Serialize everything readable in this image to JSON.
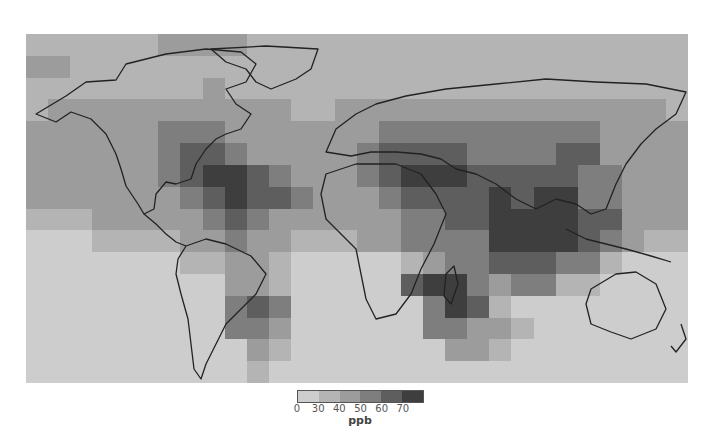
{
  "figure": {
    "type": "global choropleth map",
    "quantity_unit": "ppb"
  },
  "colorbar": {
    "unit_label": "ppb",
    "tick_labels": [
      "0",
      "30",
      "40",
      "50",
      "60",
      "70"
    ],
    "bins": [
      {
        "range": "0-30",
        "color": "#cdcdcd"
      },
      {
        "range": "30-40",
        "color": "#b4b4b4"
      },
      {
        "range": "40-50",
        "color": "#9c9c9c"
      },
      {
        "range": "50-60",
        "color": "#7e7e7e"
      },
      {
        "range": "60-70",
        "color": "#5e5e5e"
      },
      {
        "range": "70+",
        "color": "#3e3e3e"
      }
    ]
  },
  "map_grid": {
    "cols": 30,
    "rows": 16,
    "legend": "each digit = colorbar bin index (0 lightest .. 5 darkest)",
    "rows_data": [
      "111111222211111111111111111111",
      "221111111111111111111111111111",
      "111111112111111111111111111111",
      "122222222222112222222222222221",
      "222222333222222233333333332222",
      "222222344322222344443333442222",
      "222222345543222345554444433222",
      "222222234544322234444545533222",
      "111222223432222223344555544222",
      "000111122322111223333555543211",
      "000000011221000001233444331000",
      "000000000221000004553233110000",
      "000000000343000000354100000000",
      "000000000332000000332210000000",
      "000000000021000000022100000000",
      "000000000010000000000000000000"
    ]
  },
  "regions_high_ppb": [
    "Eastern United States",
    "Europe",
    "Middle East",
    "Northern India / Eastern China",
    "Central Africa",
    "Central South America (Brazil)"
  ]
}
